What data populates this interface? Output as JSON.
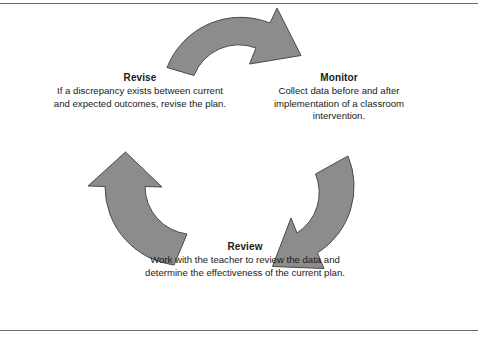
{
  "figure": {
    "border_color": "#6e6e6e",
    "background": "#ffffff",
    "arrow_fill": "#8c8c8c",
    "arrow_stroke": "#4a4a4a"
  },
  "nodes": [
    {
      "id": "monitor",
      "title": "Monitor",
      "description": "Collect data before and after implementation of a classroom intervention."
    },
    {
      "id": "review",
      "title": "Review",
      "description": "Work with the teacher to review the data and determine the effectiveness of the current plan."
    },
    {
      "id": "revise",
      "title": "Revise",
      "description": "If a discrepancy exists between current and expected outcomes, revise the plan."
    }
  ],
  "arrows": [
    {
      "id": "arrow-top",
      "from": "revise",
      "to": "monitor",
      "direction": "clockwise"
    },
    {
      "id": "arrow-right",
      "from": "monitor",
      "to": "review",
      "direction": "clockwise"
    },
    {
      "id": "arrow-left",
      "from": "review",
      "to": "revise",
      "direction": "clockwise"
    }
  ]
}
